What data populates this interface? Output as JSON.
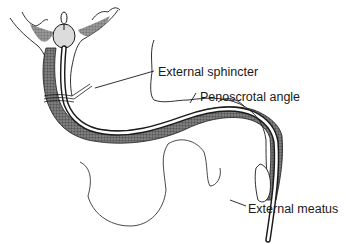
{
  "diagram": {
    "labels": [
      {
        "id": "external-sphincter",
        "text": "External sphincter"
      },
      {
        "id": "penoscrotal-angle",
        "text": "Penoscrotal angle"
      },
      {
        "id": "external-meatus",
        "text": "External meatus"
      }
    ],
    "colors": {
      "ink": "#1a1a1a",
      "stipple": "#555555",
      "background": "#ffffff"
    }
  }
}
